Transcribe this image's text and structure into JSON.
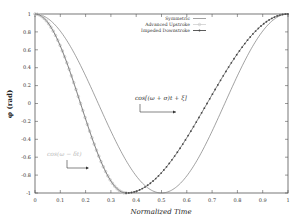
{
  "chart_data": {
    "type": "line",
    "title": "",
    "xlabel": "Normalized Time",
    "ylabel": "φ (rad)",
    "xlim": [
      0,
      1
    ],
    "ylim": [
      -1,
      1
    ],
    "grid": false,
    "legend_position": "upper-center",
    "x_ticks": [
      "0",
      "0.1",
      "0.2",
      "0.3",
      "0.4",
      "0.5",
      "0.6",
      "0.7",
      "0.8",
      "0.9",
      "1"
    ],
    "y_ticks": [
      "1",
      "0.8",
      "0.6",
      "0.4",
      "0.2",
      "0",
      "-0.2",
      "-0.4",
      "-0.6",
      "-0.8",
      "-1"
    ],
    "series": [
      {
        "name": "Symmetric",
        "style": "solid thin line",
        "color": "#7a7a7a",
        "x": [
          0,
          0.05,
          0.1,
          0.15,
          0.2,
          0.25,
          0.3,
          0.35,
          0.4,
          0.45,
          0.5,
          0.55,
          0.6,
          0.65,
          0.7,
          0.75,
          0.8,
          0.85,
          0.9,
          0.95,
          1
        ],
        "values": [
          1,
          0.95,
          0.81,
          0.59,
          0.31,
          0,
          -0.31,
          -0.59,
          -0.81,
          -0.95,
          -1,
          -0.95,
          -0.81,
          -0.59,
          -0.31,
          0,
          0.31,
          0.59,
          0.81,
          0.95,
          1
        ]
      },
      {
        "name": "Advanced Upstroke",
        "style": "light gray line with circle markers",
        "color": "#c8c8c8",
        "x": [
          0,
          0.05,
          0.1,
          0.15,
          0.2,
          0.25,
          0.3,
          0.36,
          0.4,
          0.45,
          0.5,
          0.55,
          0.6,
          0.65,
          0.7,
          0.75,
          0.8,
          0.85,
          0.9,
          0.95,
          1
        ],
        "values": [
          1,
          0.9,
          0.64,
          0.27,
          -0.15,
          -0.54,
          -0.85,
          -1,
          -0.97,
          -0.85,
          -0.66,
          -0.42,
          -0.16,
          0.1,
          0.35,
          0.57,
          0.75,
          0.88,
          0.96,
          0.99,
          1
        ]
      },
      {
        "name": "Impeded Downstroke",
        "style": "dark line with dense markers",
        "color": "#4a4a4a",
        "x": [
          0,
          0.05,
          0.1,
          0.15,
          0.2,
          0.25,
          0.3,
          0.36,
          0.4,
          0.45,
          0.5,
          0.55,
          0.6,
          0.65,
          0.7,
          0.75,
          0.8,
          0.85,
          0.9,
          0.95,
          1
        ],
        "values": [
          1,
          0.9,
          0.64,
          0.27,
          -0.15,
          -0.54,
          -0.85,
          -1,
          -0.97,
          -0.85,
          -0.66,
          -0.42,
          -0.16,
          0.1,
          0.35,
          0.57,
          0.75,
          0.88,
          0.96,
          0.99,
          1
        ]
      }
    ],
    "annotations": [
      {
        "text": "cos[(ω + σ)t + ξ]",
        "x": 0.55,
        "y": 0.05,
        "arrow": "points right to Impeded Downstroke curve"
      },
      {
        "text": "cos(ω − δt)",
        "x": 0.16,
        "y": -0.55,
        "arrow": "points right to Advanced Upstroke curve"
      }
    ]
  }
}
